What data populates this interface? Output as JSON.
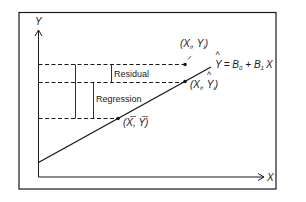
{
  "diagram": {
    "axes": {
      "x_label": "X",
      "y_label": "Y"
    },
    "labels": {
      "residual": "Residual",
      "regression": "Regression",
      "observed_point": "(X_i, Y_i)",
      "fitted_point": "(X_i, Ŷ_i)",
      "mean_point": "(X̄, Ȳ)",
      "equation": "Ŷ = B_0 + B_1 X"
    },
    "text_parts": {
      "obs_open": "(X",
      "obs_sub_i": "i",
      "obs_mid": ", Y",
      "obs_sub_i2": "i",
      "obs_close": ")",
      "fit_open": "(X",
      "fit_sub_i": "i",
      "fit_mid": ", Y",
      "fit_sub_i2": "i",
      "fit_close": ")",
      "fit_hat": "^",
      "mean_text": "(X, Y)",
      "eq_y": "Y",
      "eq_hat": "^",
      "eq_eq": "= B",
      "eq_sub0": "0",
      "eq_plus": "+ B",
      "eq_sub1": "1",
      "eq_x": "X"
    },
    "colors": {
      "ink": "#1a1a1a",
      "background": "#ffffff"
    }
  }
}
